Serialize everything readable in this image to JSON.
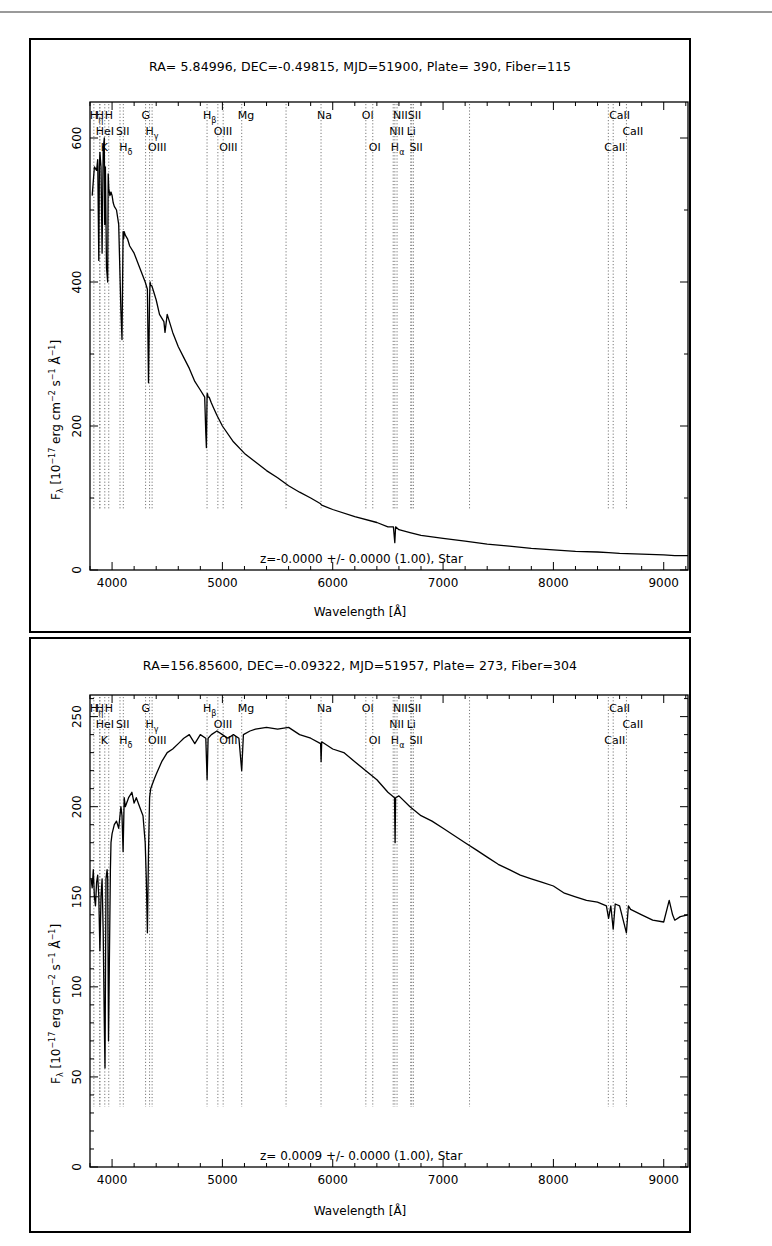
{
  "page": {
    "top_cut_text": "...spring ... ng ... g",
    "accent_color": "#000000",
    "grid_line_color": "#7a7a7a"
  },
  "chart_data": [
    {
      "type": "line",
      "title": "RA= 5.84996, DEC=-0.49815, MJD=51900, Plate= 390, Fiber=115",
      "xlabel": "Wavelength [Å]",
      "ylabel": "Fλ [10^-17 erg cm^-2 s^-1 Å^-1]",
      "ylabel_parts": {
        "main": "F",
        "sub": "λ",
        "rest1": " [10",
        "sup1": "−17",
        "rest2": " erg cm",
        "sup2": "−2",
        "rest3": " s",
        "sup3": "−1",
        "rest4": " Å",
        "sup4": "−1",
        "rest5": "]"
      },
      "annotation": "z=-0.0000 +/- 0.0000 (1.00), Star",
      "xlim": [
        3800,
        9220
      ],
      "ylim": [
        0,
        650
      ],
      "xticks": [
        4000,
        5000,
        6000,
        7000,
        8000,
        9000
      ],
      "yticks": [
        0,
        200,
        400,
        600
      ],
      "grid": false,
      "series": [
        {
          "name": "flux",
          "x": [
            3820,
            3840,
            3860,
            3870,
            3880,
            3885,
            3890,
            3900,
            3910,
            3920,
            3930,
            3933,
            3940,
            3950,
            3960,
            3965,
            3970,
            3980,
            3990,
            4000,
            4010,
            4020,
            4040,
            4060,
            4080,
            4090,
            4100,
            4102,
            4105,
            4110,
            4120,
            4140,
            4160,
            4200,
            4250,
            4300,
            4320,
            4330,
            4340,
            4345,
            4350,
            4360,
            4380,
            4400,
            4430,
            4470,
            4480,
            4500,
            4550,
            4600,
            4650,
            4700,
            4750,
            4800,
            4840,
            4850,
            4855,
            4861,
            4865,
            4870,
            4880,
            4900,
            4920,
            4950,
            5000,
            5100,
            5200,
            5300,
            5400,
            5500,
            5600,
            5700,
            5800,
            5890,
            5900,
            6000,
            6200,
            6400,
            6500,
            6550,
            6563,
            6570,
            6600,
            6700,
            6800,
            7000,
            7200,
            7400,
            7600,
            7800,
            8000,
            8200,
            8400,
            8500,
            8600,
            8800,
            9000,
            9100,
            9220
          ],
          "y": [
            520,
            560,
            555,
            570,
            430,
            560,
            580,
            560,
            440,
            585,
            600,
            480,
            560,
            420,
            400,
            550,
            530,
            520,
            525,
            520,
            510,
            505,
            500,
            480,
            360,
            320,
            470,
            470,
            460,
            470,
            465,
            460,
            450,
            440,
            420,
            400,
            390,
            260,
            380,
            400,
            395,
            395,
            385,
            375,
            355,
            345,
            330,
            355,
            330,
            310,
            295,
            280,
            262,
            250,
            240,
            190,
            170,
            245,
            245,
            240,
            240,
            232,
            225,
            215,
            200,
            178,
            162,
            150,
            138,
            128,
            117,
            108,
            100,
            92,
            90,
            84,
            74,
            66,
            60,
            60,
            38,
            60,
            56,
            52,
            48,
            44,
            40,
            36,
            33,
            30,
            28,
            26,
            25,
            24,
            23,
            22,
            21,
            20,
            20
          ]
        }
      ],
      "line_markers": [
        {
          "label": "Hη",
          "x": 3835,
          "row": 0
        },
        {
          "label": "H",
          "x": 3889,
          "row": 0
        },
        {
          "label": "HeI",
          "x": 3889,
          "row": 1
        },
        {
          "label": "K",
          "x": 3934,
          "row": 2
        },
        {
          "label": "H",
          "x": 3970,
          "row": 0
        },
        {
          "label": "SII",
          "x": 4072,
          "row": 1
        },
        {
          "label": "Hδ",
          "x": 4102,
          "row": 2
        },
        {
          "label": "G",
          "x": 4304,
          "row": 0
        },
        {
          "label": "Hγ",
          "x": 4340,
          "row": 1
        },
        {
          "label": "OIII",
          "x": 4363,
          "row": 2
        },
        {
          "label": "Hβ",
          "x": 4861,
          "row": 0
        },
        {
          "label": "OIII",
          "x": 4959,
          "row": 1
        },
        {
          "label": "OIII",
          "x": 5007,
          "row": 2
        },
        {
          "label": "Mg",
          "x": 5175,
          "row": 0
        },
        {
          "label": "",
          "x": 5577,
          "row": -1
        },
        {
          "label": "Na",
          "x": 5894,
          "row": 0
        },
        {
          "label": "OI",
          "x": 6300,
          "row": 0
        },
        {
          "label": "OI",
          "x": 6363,
          "row": 2
        },
        {
          "label": "NII",
          "x": 6548,
          "row": 1
        },
        {
          "label": "Hα",
          "x": 6563,
          "row": 2
        },
        {
          "label": "NII",
          "x": 6583,
          "row": 0
        },
        {
          "label": "Li",
          "x": 6707,
          "row": 1
        },
        {
          "label": "SII",
          "x": 6716,
          "row": 0
        },
        {
          "label": "SII",
          "x": 6731,
          "row": 2
        },
        {
          "label": "",
          "x": 7240,
          "row": -1
        },
        {
          "label": "CaII",
          "x": 8498,
          "row": 2
        },
        {
          "label": "CaII",
          "x": 8542,
          "row": 0
        },
        {
          "label": "CaII",
          "x": 8662,
          "row": 1
        }
      ]
    },
    {
      "type": "line",
      "title": "RA=156.85600, DEC=-0.09322, MJD=51957, Plate= 273, Fiber=304",
      "xlabel": "Wavelength [Å]",
      "ylabel": "Fλ [10^-17 erg cm^-2 s^-1 Å^-1]",
      "ylabel_parts": {
        "main": "F",
        "sub": "λ",
        "rest1": " [10",
        "sup1": "−17",
        "rest2": " erg cm",
        "sup2": "−2",
        "rest3": " s",
        "sup3": "−1",
        "rest4": " Å",
        "sup4": "−1",
        "rest5": "]"
      },
      "annotation": "z= 0.0009 +/- 0.0000 (1.00), Star",
      "xlim": [
        3800,
        9220
      ],
      "ylim": [
        0,
        262
      ],
      "xticks": [
        4000,
        5000,
        6000,
        7000,
        8000,
        9000
      ],
      "yticks": [
        0,
        50,
        100,
        150,
        200,
        250
      ],
      "grid": false,
      "series": [
        {
          "name": "flux",
          "x": [
            3810,
            3820,
            3830,
            3840,
            3850,
            3860,
            3870,
            3880,
            3890,
            3900,
            3910,
            3920,
            3930,
            3936,
            3945,
            3955,
            3960,
            3968,
            3975,
            3985,
            3990,
            4000,
            4020,
            4040,
            4060,
            4080,
            4090,
            4100,
            4110,
            4120,
            4150,
            4180,
            4200,
            4220,
            4250,
            4280,
            4300,
            4310,
            4320,
            4330,
            4340,
            4350,
            4380,
            4400,
            4450,
            4500,
            4550,
            4600,
            4650,
            4700,
            4750,
            4800,
            4850,
            4861,
            4870,
            4900,
            4950,
            5000,
            5050,
            5100,
            5150,
            5175,
            5190,
            5250,
            5300,
            5400,
            5500,
            5600,
            5700,
            5800,
            5890,
            5895,
            5900,
            6000,
            6100,
            6200,
            6300,
            6400,
            6500,
            6560,
            6565,
            6570,
            6600,
            6700,
            6800,
            6900,
            7000,
            7100,
            7200,
            7300,
            7400,
            7500,
            7600,
            7700,
            7800,
            7900,
            8000,
            8100,
            8200,
            8300,
            8400,
            8480,
            8500,
            8520,
            8542,
            8560,
            8600,
            8662,
            8680,
            8700,
            8800,
            8900,
            9000,
            9050,
            9080,
            9100,
            9150,
            9220
          ],
          "y": [
            160,
            155,
            165,
            150,
            145,
            158,
            162,
            150,
            120,
            150,
            160,
            130,
            80,
            55,
            160,
            165,
            160,
            70,
            110,
            165,
            180,
            185,
            190,
            192,
            188,
            200,
            195,
            175,
            205,
            200,
            205,
            208,
            202,
            205,
            200,
            195,
            180,
            160,
            130,
            175,
            205,
            210,
            215,
            218,
            225,
            230,
            232,
            235,
            238,
            240,
            235,
            240,
            238,
            215,
            238,
            240,
            242,
            240,
            238,
            240,
            238,
            220,
            240,
            242,
            243,
            244,
            243,
            244,
            240,
            238,
            235,
            225,
            236,
            232,
            230,
            225,
            220,
            215,
            208,
            205,
            180,
            205,
            206,
            200,
            195,
            192,
            188,
            184,
            180,
            176,
            172,
            168,
            165,
            162,
            160,
            158,
            156,
            152,
            150,
            148,
            147,
            145,
            138,
            145,
            132,
            146,
            145,
            130,
            145,
            143,
            140,
            137,
            136,
            148,
            140,
            137,
            139,
            140
          ]
        }
      ],
      "line_markers": [
        {
          "label": "Hη",
          "x": 3835,
          "row": 0
        },
        {
          "label": "H",
          "x": 3889,
          "row": 0
        },
        {
          "label": "HeI",
          "x": 3889,
          "row": 1
        },
        {
          "label": "K",
          "x": 3934,
          "row": 2
        },
        {
          "label": "H",
          "x": 3970,
          "row": 0
        },
        {
          "label": "SII",
          "x": 4072,
          "row": 1
        },
        {
          "label": "Hδ",
          "x": 4102,
          "row": 2
        },
        {
          "label": "G",
          "x": 4304,
          "row": 0
        },
        {
          "label": "Hγ",
          "x": 4340,
          "row": 1
        },
        {
          "label": "OIII",
          "x": 4363,
          "row": 2
        },
        {
          "label": "Hβ",
          "x": 4861,
          "row": 0
        },
        {
          "label": "OIII",
          "x": 4959,
          "row": 1
        },
        {
          "label": "OIII",
          "x": 5007,
          "row": 2
        },
        {
          "label": "Mg",
          "x": 5175,
          "row": 0
        },
        {
          "label": "",
          "x": 5577,
          "row": -1
        },
        {
          "label": "Na",
          "x": 5894,
          "row": 0
        },
        {
          "label": "OI",
          "x": 6300,
          "row": 0
        },
        {
          "label": "OI",
          "x": 6363,
          "row": 2
        },
        {
          "label": "NII",
          "x": 6548,
          "row": 1
        },
        {
          "label": "Hα",
          "x": 6563,
          "row": 2
        },
        {
          "label": "NII",
          "x": 6583,
          "row": 0
        },
        {
          "label": "Li",
          "x": 6707,
          "row": 1
        },
        {
          "label": "SII",
          "x": 6716,
          "row": 0
        },
        {
          "label": "SII",
          "x": 6731,
          "row": 2
        },
        {
          "label": "",
          "x": 7240,
          "row": -1
        },
        {
          "label": "CaII",
          "x": 8498,
          "row": 2
        },
        {
          "label": "CaII",
          "x": 8542,
          "row": 0
        },
        {
          "label": "CaII",
          "x": 8662,
          "row": 1
        }
      ]
    }
  ]
}
